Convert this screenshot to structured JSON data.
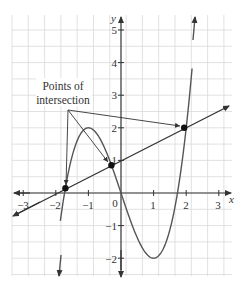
{
  "chart_data": {
    "type": "line",
    "title": "",
    "xlabel": "x",
    "ylabel": "y",
    "xlim": [
      -3.3,
      3.4
    ],
    "ylim": [
      -2.5,
      5.5
    ],
    "grid": true,
    "grid_step": 0.5,
    "x_ticks": [
      "-3",
      "-2",
      "-1",
      "0",
      "1",
      "2",
      "3"
    ],
    "y_ticks": [
      "-2",
      "-1",
      "1",
      "2",
      "3",
      "4",
      "5"
    ],
    "series": [
      {
        "name": "cubic",
        "expression": "y = x^3 - 3x",
        "x": [
          -2.3,
          -2,
          -1.5,
          -1,
          -0.5,
          0,
          0.5,
          1,
          1.5,
          2,
          2.3
        ],
        "values": [
          -5.267,
          -2,
          1.125,
          2,
          1.375,
          0,
          -1.375,
          -2,
          -1.125,
          2,
          5.267
        ]
      },
      {
        "name": "line",
        "expression": "y = 0.5x + 1",
        "x": [
          -3.3,
          3.3
        ],
        "values": [
          -0.65,
          2.65
        ]
      }
    ],
    "intersection_points": [
      {
        "x": -1.707,
        "y": 0.146
      },
      {
        "x": -0.293,
        "y": 0.854
      },
      {
        "x": 2,
        "y": 2
      }
    ],
    "annotations": [
      {
        "text_line1": "Points of",
        "text_line2": "intersection",
        "arrows_to": [
          "(-1.707,0.146)",
          "(-0.293,0.854)",
          "(2,2)"
        ]
      }
    ]
  },
  "labels": {
    "annotation_line1": "Points of",
    "annotation_line2": "intersection",
    "x_axis": "x",
    "y_axis": "y",
    "x_ticks": [
      "−3",
      "−2",
      "−1",
      "0",
      "1",
      "2",
      "3"
    ],
    "y_ticks": [
      "−2",
      "−1",
      "1",
      "2",
      "3",
      "4",
      "5"
    ]
  }
}
